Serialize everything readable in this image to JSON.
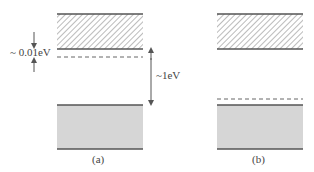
{
  "diagram": {
    "panels": [
      {
        "label": "(a)",
        "description": "donor level ~0.01eV below conduction band"
      },
      {
        "label": "(b)",
        "description": "acceptor level just above valence band"
      }
    ],
    "annotations": {
      "small_gap": "~ 0.01eV",
      "band_gap": "~1eV"
    },
    "colors": {
      "band_edge": "#555555",
      "valence_fill": "#d6d6d6",
      "hatch": "#666666"
    }
  }
}
